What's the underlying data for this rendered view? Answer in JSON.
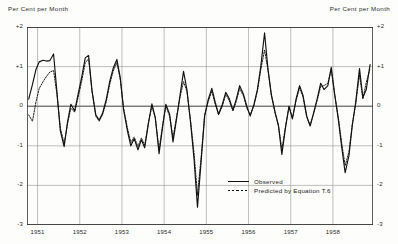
{
  "header": {
    "left_label": "Per Cent per Month",
    "right_label": "Per Cent per Month"
  },
  "legend": {
    "observed": "Observed",
    "predicted": "Predicted by Equation T.6"
  },
  "axis": {
    "y_ticks": [
      "+2",
      "+1",
      "0",
      "-1",
      "-2",
      "-3"
    ],
    "x_ticks": [
      "1951",
      "1952",
      "1953",
      "1954",
      "1955",
      "1956",
      "1957",
      "1958"
    ]
  },
  "chart_data": {
    "type": "line",
    "title": "",
    "subtitle": "",
    "xlabel": "",
    "ylabel": "Per Cent per Month",
    "ylim": [
      -3,
      2
    ],
    "xlim": [
      1950.75,
      1958.95
    ],
    "grid": true,
    "legend_position": "bottom-right",
    "y_ticks": [
      2,
      1,
      0,
      -1,
      -2,
      -3
    ],
    "x_ticks": [
      1951,
      1952,
      1953,
      1954,
      1955,
      1956,
      1957,
      1958
    ],
    "x_unit": "year (monthly observations)",
    "series": [
      {
        "name": "Observed",
        "style": "solid",
        "color": "#111111",
        "x": [
          1950.79,
          1950.88,
          1950.96,
          1951.04,
          1951.13,
          1951.21,
          1951.29,
          1951.38,
          1951.46,
          1951.54,
          1951.63,
          1951.71,
          1951.79,
          1951.88,
          1951.96,
          1952.04,
          1952.13,
          1952.21,
          1952.29,
          1952.38,
          1952.46,
          1952.54,
          1952.63,
          1952.71,
          1952.79,
          1952.88,
          1952.96,
          1953.04,
          1953.13,
          1953.21,
          1953.29,
          1953.38,
          1953.46,
          1953.54,
          1953.63,
          1953.71,
          1953.79,
          1953.88,
          1953.96,
          1954.04,
          1954.13,
          1954.21,
          1954.29,
          1954.38,
          1954.46,
          1954.54,
          1954.63,
          1954.71,
          1954.79,
          1954.88,
          1954.96,
          1955.04,
          1955.13,
          1955.21,
          1955.29,
          1955.38,
          1955.46,
          1955.54,
          1955.63,
          1955.71,
          1955.79,
          1955.88,
          1955.96,
          1956.04,
          1956.13,
          1956.21,
          1956.29,
          1956.38,
          1956.46,
          1956.54,
          1956.63,
          1956.71,
          1956.79,
          1956.88,
          1956.96,
          1957.04,
          1957.13,
          1957.21,
          1957.29,
          1957.38,
          1957.46,
          1957.54,
          1957.63,
          1957.71,
          1957.79,
          1957.88,
          1957.96,
          1958.04,
          1958.13,
          1958.21,
          1958.29,
          1958.38,
          1958.46,
          1958.54,
          1958.63,
          1958.71,
          1958.79,
          1958.88
        ],
        "y": [
          0.18,
          0.55,
          0.92,
          1.12,
          1.16,
          1.14,
          1.15,
          1.32,
          0.35,
          -0.62,
          -1.02,
          -0.4,
          0.05,
          -0.12,
          0.3,
          0.7,
          1.22,
          1.28,
          0.4,
          -0.22,
          -0.35,
          -0.18,
          0.18,
          0.62,
          0.95,
          1.18,
          0.72,
          -0.1,
          -0.62,
          -1.0,
          -0.82,
          -1.1,
          -0.85,
          -1.05,
          -0.42,
          0.06,
          -0.28,
          -1.2,
          -0.55,
          0.05,
          -0.2,
          -0.9,
          -0.35,
          0.3,
          0.88,
          0.42,
          -0.45,
          -1.35,
          -2.55,
          -1.35,
          -0.25,
          0.15,
          0.45,
          0.1,
          -0.2,
          0.05,
          0.35,
          0.2,
          -0.1,
          0.18,
          0.52,
          0.3,
          0.0,
          -0.25,
          0.05,
          0.42,
          1.0,
          1.85,
          0.95,
          0.3,
          -0.15,
          -0.5,
          -1.22,
          -0.52,
          0.0,
          -0.32,
          0.2,
          0.52,
          0.28,
          -0.25,
          -0.5,
          -0.18,
          0.2,
          0.58,
          0.42,
          0.52,
          0.98,
          0.32,
          -0.35,
          -1.05,
          -1.68,
          -1.25,
          -0.48,
          0.1,
          0.95,
          0.22,
          0.42,
          1.05
        ]
      },
      {
        "name": "Predicted by Equation T.6",
        "style": "dashed",
        "color": "#111111",
        "x": [
          1950.79,
          1950.88,
          1950.96,
          1951.04,
          1951.13,
          1951.21,
          1951.29,
          1951.38,
          1951.46,
          1951.54,
          1951.63,
          1951.71,
          1951.79,
          1951.88,
          1951.96,
          1952.04,
          1952.13,
          1952.21,
          1952.29,
          1952.38,
          1952.46,
          1952.54,
          1952.63,
          1952.71,
          1952.79,
          1952.88,
          1952.96,
          1953.04,
          1953.13,
          1953.21,
          1953.29,
          1953.38,
          1953.46,
          1953.54,
          1953.63,
          1953.71,
          1953.79,
          1953.88,
          1953.96,
          1954.04,
          1954.13,
          1954.21,
          1954.29,
          1954.38,
          1954.46,
          1954.54,
          1954.63,
          1954.71,
          1954.79,
          1954.88,
          1954.96,
          1955.04,
          1955.13,
          1955.21,
          1955.29,
          1955.38,
          1955.46,
          1955.54,
          1955.63,
          1955.71,
          1955.79,
          1955.88,
          1955.96,
          1956.04,
          1956.13,
          1956.21,
          1956.29,
          1956.38,
          1956.46,
          1956.54,
          1956.63,
          1956.71,
          1956.79,
          1956.88,
          1956.96,
          1957.04,
          1957.13,
          1957.21,
          1957.29,
          1957.38,
          1957.46,
          1957.54,
          1957.63,
          1957.71,
          1957.79,
          1957.88,
          1957.96,
          1958.04,
          1958.13,
          1958.21,
          1958.29,
          1958.38,
          1958.46,
          1958.54,
          1958.63,
          1958.71,
          1958.79,
          1958.88
        ],
        "y": [
          -0.22,
          -0.38,
          0.1,
          0.45,
          0.62,
          0.75,
          0.86,
          0.9,
          0.3,
          -0.55,
          -0.95,
          -0.45,
          -0.05,
          -0.15,
          0.22,
          0.6,
          1.1,
          1.2,
          0.38,
          -0.25,
          -0.38,
          -0.22,
          0.12,
          0.55,
          0.88,
          1.1,
          0.68,
          -0.05,
          -0.55,
          -0.92,
          -0.78,
          -1.02,
          -0.8,
          -0.98,
          -0.4,
          0.0,
          -0.3,
          -1.1,
          -0.5,
          0.0,
          -0.25,
          -0.8,
          -0.3,
          0.25,
          0.62,
          0.38,
          -0.4,
          -1.2,
          -2.25,
          -1.25,
          -0.22,
          0.1,
          0.38,
          0.05,
          -0.22,
          0.0,
          0.3,
          0.15,
          -0.12,
          0.12,
          0.45,
          0.26,
          -0.05,
          -0.22,
          0.02,
          0.38,
          0.92,
          1.42,
          0.92,
          0.28,
          -0.18,
          -0.48,
          -1.1,
          -0.48,
          -0.02,
          -0.3,
          0.15,
          0.46,
          0.24,
          -0.28,
          -0.48,
          -0.2,
          0.16,
          0.5,
          0.52,
          0.58,
          0.92,
          0.3,
          -0.3,
          -0.95,
          -1.5,
          -1.15,
          -0.45,
          0.05,
          0.8,
          0.18,
          0.6,
          0.95
        ]
      }
    ]
  }
}
